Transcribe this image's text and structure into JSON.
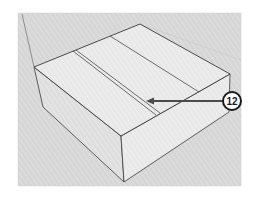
{
  "figure": {
    "colors": {
      "background": "#ffffff",
      "viewport": "#d4d4d4",
      "top_face": "#e6e6e6",
      "left_face": "#dcdcdc",
      "front_face": "#ececec",
      "edge": "#3a3a3a",
      "arrow": "#4a4a4a",
      "callout_fill": "#ffffff",
      "callout_stroke": "#1a1a1a"
    }
  },
  "callout": {
    "label": "12",
    "target": "groove"
  }
}
